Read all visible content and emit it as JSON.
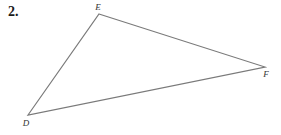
{
  "problem": {
    "number": "2."
  },
  "diagram": {
    "type": "triangle",
    "stroke_color": "#7a7a7a",
    "vertices": [
      {
        "name": "E",
        "x": 99,
        "y": 14,
        "label_x": 98,
        "label_y": 10
      },
      {
        "name": "F",
        "x": 265,
        "y": 67,
        "label_x": 266,
        "label_y": 77
      },
      {
        "name": "D",
        "x": 28,
        "y": 115,
        "label_x": 26,
        "label_y": 126
      }
    ],
    "labels": {
      "E": "E",
      "F": "F",
      "D": "D"
    }
  }
}
